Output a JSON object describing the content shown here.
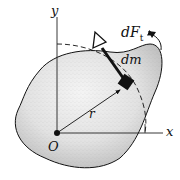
{
  "figure": {
    "labels": {
      "y_axis": "y",
      "x_axis": "x",
      "origin": "O",
      "radius": "r",
      "mass_element": "dm",
      "force_main": "dF",
      "force_sub": "t"
    },
    "colors": {
      "ink": "#111111",
      "body_fill": "#d8d8d8",
      "background": "#ffffff"
    },
    "elements": [
      "rigid body (irregular stippled shape)",
      "x-y coordinate axes with origin O",
      "position vector r from O to dm",
      "mass element dm (filled square)",
      "tangential force dF_t (hollow-head arrow)",
      "dashed circular path of dm",
      "curved arrow indicating rotation direction"
    ]
  }
}
